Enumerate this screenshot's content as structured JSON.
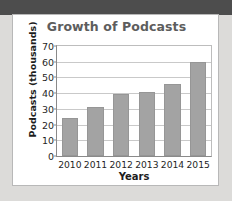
{
  "chart_data": {
    "type": "bar",
    "title": "Growth of Podcasts",
    "xlabel": "Years",
    "ylabel": "Podcasts (thousands)",
    "categories": [
      "2010",
      "2011",
      "2012",
      "2013",
      "2014",
      "2015"
    ],
    "values": [
      24,
      31.5,
      39.5,
      41,
      46,
      60
    ],
    "ylim": [
      0,
      70
    ],
    "ytick_labels": [
      "0",
      "10",
      "20",
      "30",
      "40",
      "50",
      "60",
      "70"
    ],
    "ytick_values": [
      0,
      10,
      20,
      30,
      40,
      50,
      60,
      70
    ],
    "grid": "horizontal",
    "legend": "none",
    "series": [
      {
        "name": "Podcasts",
        "values": [
          24,
          31.5,
          39.5,
          41,
          46,
          60
        ]
      }
    ],
    "colors": {
      "bar_fill": "#a3a3a3",
      "bar_edge": "#969696",
      "gridline": "#c9c9c9",
      "axis": "#8a8a8a",
      "title_text": "#5d5d5d",
      "tick_text": "#1f1f1f",
      "card_background": "#ffffff",
      "page_background": "#dcdbd9",
      "top_band": "#4d4d4d"
    }
  }
}
